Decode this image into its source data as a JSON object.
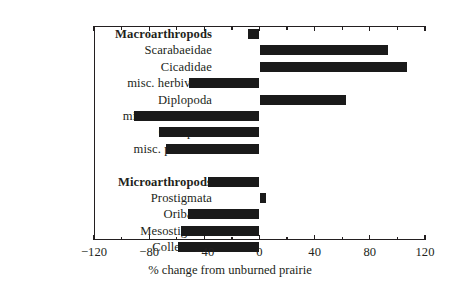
{
  "chart_data": {
    "type": "bar",
    "orientation": "horizontal",
    "title": "",
    "xlabel": "% change from unburned prairie",
    "ylabel": "",
    "xlim": [
      -120,
      120
    ],
    "xticks": [
      -120,
      -80,
      -40,
      0,
      40,
      80,
      120
    ],
    "xtick_labels": [
      "−120",
      "−80",
      "−40",
      "0",
      "40",
      "80",
      "120"
    ],
    "minor_tick_interval": 20,
    "grid": false,
    "legend": null,
    "zero_reference_line": 0,
    "groups": [
      {
        "name": "Macroarthropods",
        "categories": [
          "Macroarthropods",
          "Scarabaeidae",
          "Cicadidae",
          "misc. herbivores",
          "Diplopoda",
          "misc. detritivores",
          "Chilopoda",
          "misc. predators"
        ],
        "values": [
          -8,
          93,
          107,
          -51,
          63,
          -91,
          -73,
          -68
        ]
      },
      {
        "name": "Microarthropods",
        "categories": [
          "Microarthropods",
          "Prostigmata",
          "Oribatida",
          "Mesostigmata",
          "Collembola"
        ],
        "values": [
          -37,
          5,
          -52,
          -57,
          -59
        ]
      }
    ],
    "categories": [
      "Macroarthropods",
      "Scarabaeidae",
      "Cicadidae",
      "misc. herbivores",
      "Diplopoda",
      "misc. detritivores",
      "Chilopoda",
      "misc. predators",
      "",
      "Microarthropods",
      "Prostigmata",
      "Oribatida",
      "Mesostigmata",
      "Collembola"
    ],
    "values": [
      -8,
      93,
      107,
      -51,
      63,
      -91,
      -73,
      -68,
      null,
      -37,
      5,
      -52,
      -57,
      -59
    ],
    "bold_categories": [
      "Macroarthropods",
      "Microarthropods"
    ],
    "bar_color": "#1a1a1a",
    "axis_color": "#231f20",
    "background_color": "#ffffff"
  }
}
